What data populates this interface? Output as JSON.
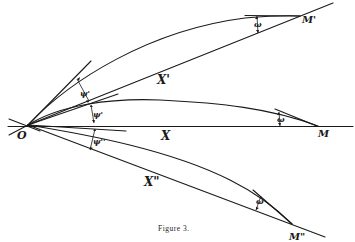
{
  "figure": {
    "caption": "Figure 3.",
    "points": {
      "origin": "O",
      "M": "M",
      "M_prime": "M'",
      "M_double_prime": "M\""
    },
    "curve_labels": {
      "upper": "X'",
      "middle": "X",
      "lower": "X\""
    },
    "angle_labels": {
      "psi_upper": "ψ'",
      "psi_middle": "ψ'",
      "psi_lower": "ψ''",
      "omega_upper": "ω",
      "omega_middle": "ω",
      "omega_lower": "ω"
    },
    "colors": {
      "ink": "#1a1a1a",
      "paper": "#ffffff"
    }
  }
}
